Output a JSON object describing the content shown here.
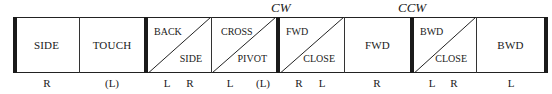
{
  "diagram": {
    "rotation_labels": [
      {
        "text": "CW",
        "x": 271
      },
      {
        "text": "CCW",
        "x": 398
      }
    ],
    "cells": [
      {
        "type": "single",
        "text": "SIDE",
        "left": 14,
        "width": 66,
        "thick_left": true
      },
      {
        "type": "single",
        "text": "TOUCH",
        "left": 80,
        "width": 65,
        "thick_left": false
      },
      {
        "type": "split",
        "top_left": "BACK",
        "bottom_right": "SIDE",
        "left": 145,
        "width": 67,
        "thick_left": true
      },
      {
        "type": "split",
        "top_left": "CROSS",
        "bottom_right": "PIVOT",
        "left": 212,
        "width": 65,
        "thick_left": false
      },
      {
        "type": "split",
        "top_left": "FWD",
        "bottom_right": "CLOSE",
        "left": 277,
        "width": 68,
        "thick_left": true
      },
      {
        "type": "single",
        "text": "FWD",
        "left": 345,
        "width": 66,
        "thick_left": false
      },
      {
        "type": "split",
        "top_left": "BWD",
        "bottom_right": "CLOSE",
        "left": 411,
        "width": 66,
        "thick_left": true
      },
      {
        "type": "single",
        "text": "BWD",
        "left": 477,
        "width": 75,
        "thick_left": false,
        "thick_right": true
      }
    ],
    "feet": [
      {
        "text": "R",
        "x": 47
      },
      {
        "text": "(L)",
        "x": 112
      },
      {
        "text": "L",
        "x": 167
      },
      {
        "text": "R",
        "x": 190
      },
      {
        "text": "L",
        "x": 230
      },
      {
        "text": "(L)",
        "x": 263
      },
      {
        "text": "R",
        "x": 299
      },
      {
        "text": "L",
        "x": 322
      },
      {
        "text": "R",
        "x": 377
      },
      {
        "text": "L",
        "x": 432
      },
      {
        "text": "R",
        "x": 454
      },
      {
        "text": "L",
        "x": 511
      }
    ]
  }
}
